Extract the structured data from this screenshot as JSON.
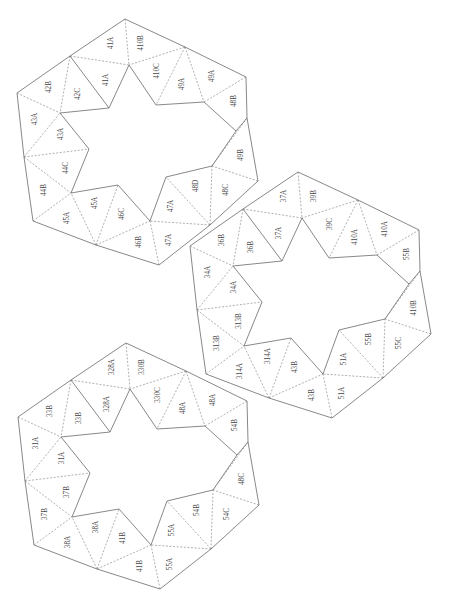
{
  "diagram": {
    "type": "origami-net",
    "colors": {
      "background": "#ffffff",
      "line": "#6a6a6a",
      "fold": "#7a7a7a",
      "text": "#444444"
    },
    "geometry": {
      "outer": [
        [
          125,
          19
        ],
        [
          185,
          47
        ],
        [
          246,
          77
        ],
        [
          247,
          118
        ],
        [
          258,
          181
        ],
        [
          210,
          225
        ],
        [
          159,
          265
        ],
        [
          96,
          245
        ],
        [
          33,
          221
        ],
        [
          24,
          157
        ],
        [
          17,
          93
        ],
        [
          70,
          56
        ]
      ],
      "inner": [
        [
          129,
          65
        ],
        [
          156,
          105
        ],
        [
          204,
          102
        ],
        [
          236,
          131
        ],
        [
          212,
          166
        ],
        [
          166,
          177
        ],
        [
          150,
          221
        ],
        [
          118,
          185
        ],
        [
          71,
          193
        ],
        [
          89,
          149
        ],
        [
          60,
          113
        ],
        [
          109,
          108
        ]
      ],
      "label_positions": [
        [
          111,
          43
        ],
        [
          141,
          43
        ],
        [
          157,
          71
        ],
        [
          182,
          84
        ],
        [
          212,
          76
        ],
        [
          234,
          101
        ],
        [
          241,
          155
        ],
        [
          226,
          190
        ],
        [
          196,
          186
        ],
        [
          171,
          206
        ],
        [
          169,
          240
        ],
        [
          139,
          242
        ],
        [
          122,
          214
        ],
        [
          95,
          203
        ],
        [
          67,
          218
        ],
        [
          44,
          190
        ],
        [
          66,
          168
        ],
        [
          61,
          134
        ],
        [
          35,
          119
        ],
        [
          49,
          87
        ],
        [
          78,
          94
        ],
        [
          106,
          80
        ]
      ]
    },
    "stars": [
      {
        "name": "star-top-left",
        "offset": [
          0,
          0
        ],
        "labels": [
          "41A",
          "410B",
          "410C",
          "49A",
          "49A",
          "48B",
          "49B",
          "48C",
          "48D",
          "47A",
          "47A",
          "46B",
          "46C",
          "45A",
          "45A",
          "44B",
          "44C",
          "43A",
          "43A",
          "42B",
          "42C",
          "41A"
        ]
      },
      {
        "name": "star-middle-right",
        "offset": [
          173,
          153
        ],
        "labels": [
          "37A",
          "39B",
          "39C",
          "410A",
          "410A",
          "55B",
          "410B",
          "55C",
          "55B",
          "51A",
          "51A",
          "43B",
          "43B",
          "314A",
          "314A",
          "313B",
          "313B",
          "34A",
          "34A",
          "36B",
          "36B",
          "37A"
        ]
      },
      {
        "name": "star-bottom-left",
        "offset": [
          1,
          324
        ],
        "labels": [
          "328A",
          "330B",
          "330C",
          "48A",
          "48A",
          "54B",
          "48C",
          "54C",
          "54B",
          "55A",
          "55A",
          "41B",
          "41B",
          "38A",
          "38A",
          "37B",
          "37B",
          "31A",
          "31A",
          "33B",
          "33B",
          "328A"
        ]
      }
    ]
  }
}
